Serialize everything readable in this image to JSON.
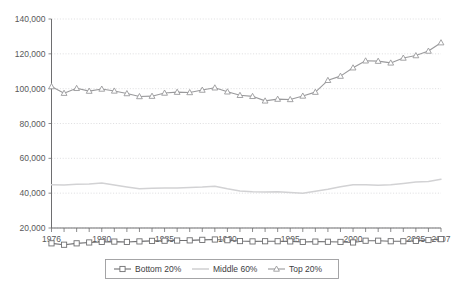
{
  "chart_data": {
    "type": "line",
    "title": "",
    "subtitle": "",
    "xlabel": "",
    "ylabel": "",
    "grid": true,
    "legend_position": "bottom",
    "xlim": [
      1976,
      2007
    ],
    "ylim": [
      0,
      140000
    ],
    "y_ticks": [
      20000,
      40000,
      60000,
      80000,
      100000,
      120000,
      140000
    ],
    "y_tick_labels": [
      "20,000",
      "40,000",
      "60,000",
      "80,000",
      "100,000",
      "120,000",
      "140,000"
    ],
    "x_ticks": [
      1976,
      1977,
      1978,
      1979,
      1980,
      1981,
      1982,
      1983,
      1984,
      1985,
      1986,
      1987,
      1988,
      1989,
      1990,
      1991,
      1992,
      1993,
      1994,
      1995,
      1996,
      1997,
      1998,
      1999,
      2000,
      2001,
      2002,
      2003,
      2004,
      2005,
      2006,
      2007
    ],
    "x_tick_labels": [
      {
        "value": 1976,
        "label": "1976"
      },
      {
        "value": 1980,
        "label": "1980"
      },
      {
        "value": 1985,
        "label": "1985"
      },
      {
        "value": 1990,
        "label": "1990"
      },
      {
        "value": 1995,
        "label": "1995"
      },
      {
        "value": 2000,
        "label": "2000"
      },
      {
        "value": 2005,
        "label": "2005"
      },
      {
        "value": 2007,
        "label": "2007"
      }
    ],
    "x": [
      1976,
      1977,
      1978,
      1979,
      1980,
      1981,
      1982,
      1983,
      1984,
      1985,
      1986,
      1987,
      1988,
      1989,
      1990,
      1991,
      1992,
      1993,
      1994,
      1995,
      1996,
      1997,
      1998,
      1999,
      2000,
      2001,
      2002,
      2003,
      2004,
      2005,
      2006,
      2007
    ],
    "series": [
      {
        "name": "Bottom 20%",
        "color": "#6f6f71",
        "marker": "square",
        "values": [
          11200,
          10400,
          11200,
          11700,
          12000,
          12200,
          12000,
          12300,
          12600,
          12700,
          12800,
          12900,
          13200,
          13400,
          13000,
          12500,
          12300,
          12400,
          12400,
          12300,
          12000,
          12200,
          12100,
          12000,
          11700,
          12700,
          12700,
          12400,
          12400,
          12600,
          13100,
          13600
        ]
      },
      {
        "name": "Middle 60%",
        "color": "#d2d2d4",
        "marker": "none",
        "values": [
          44800,
          44700,
          45100,
          45300,
          45900,
          44700,
          43600,
          42600,
          42800,
          43000,
          43000,
          43200,
          43500,
          44000,
          42500,
          41300,
          40800,
          40600,
          40800,
          40400,
          40000,
          41100,
          42300,
          43700,
          44800,
          44900,
          44600,
          44900,
          45600,
          46400,
          46700,
          48000
        ]
      },
      {
        "name": "Top 20%",
        "color": "#9a9a9c",
        "marker": "triangle",
        "values": [
          101200,
          97400,
          100200,
          98600,
          99800,
          98700,
          97200,
          95500,
          95700,
          97500,
          98000,
          97800,
          99200,
          100500,
          98200,
          96200,
          95600,
          93000,
          94000,
          93800,
          95800,
          98000,
          104800,
          107200,
          112000,
          116000,
          115800,
          114800,
          117600,
          119000,
          121600,
          126400
        ]
      }
    ],
    "legend_entries": [
      {
        "label": "Bottom 20%",
        "marker": "square",
        "color": "#6f6f71"
      },
      {
        "label": "Middle 60%",
        "marker": "none",
        "color": "#d2d2d4"
      },
      {
        "label": "Top 20%",
        "marker": "triangle",
        "color": "#9a9a9c"
      }
    ]
  }
}
